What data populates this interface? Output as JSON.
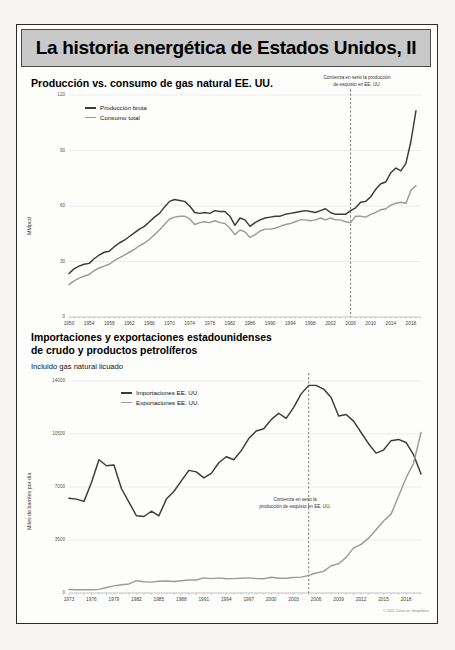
{
  "banner": {
    "title": "La historia energética de Estados Unidos, II"
  },
  "credit": "© 2022 Julian on Geopolitics",
  "chart_data": [
    {
      "type": "line",
      "title": "Producción vs. consumo de gas natural EE. UU.",
      "subtitle": "",
      "xlabel": "",
      "ylabel": "MMpcd",
      "ylim": [
        0,
        120
      ],
      "yticks": [
        0,
        30,
        60,
        90,
        120
      ],
      "xlim": [
        1950,
        2020
      ],
      "xticks": [
        1950,
        1954,
        1958,
        1962,
        1966,
        1970,
        1974,
        1978,
        1982,
        1986,
        1990,
        1994,
        1998,
        2002,
        2006,
        2010,
        2014,
        2018
      ],
      "grid": true,
      "legend_position": "top-left",
      "annotation": "Comienza en serio la producción\nde esquisto en EE. UU.",
      "annotation_line_1": "Comienza en serio la producción",
      "annotation_line_2": "de esquisto en EE. UU.",
      "annotation_x": 2006,
      "colors": {
        "produccion": "#3a3a3a",
        "consumo": "#9b9b9b"
      },
      "x": [
        1950,
        1951,
        1952,
        1953,
        1954,
        1955,
        1956,
        1957,
        1958,
        1959,
        1960,
        1961,
        1962,
        1963,
        1964,
        1965,
        1966,
        1967,
        1968,
        1969,
        1970,
        1971,
        1972,
        1973,
        1974,
        1975,
        1976,
        1977,
        1978,
        1979,
        1980,
        1981,
        1982,
        1983,
        1984,
        1985,
        1986,
        1987,
        1988,
        1989,
        1990,
        1991,
        1992,
        1993,
        1994,
        1995,
        1996,
        1997,
        1998,
        1999,
        2000,
        2001,
        2002,
        2003,
        2004,
        2005,
        2006,
        2007,
        2008,
        2009,
        2010,
        2011,
        2012,
        2013,
        2014,
        2015,
        2016,
        2017,
        2018,
        2019
      ],
      "series": [
        {
          "name": "Producción bruta",
          "values": [
            23.5,
            26.0,
            27.5,
            28.5,
            29.0,
            31.5,
            33.5,
            35.0,
            35.5,
            38.0,
            40.0,
            41.5,
            43.5,
            45.5,
            47.5,
            49.0,
            51.5,
            54.0,
            56.0,
            59.5,
            62.5,
            63.5,
            63.0,
            62.5,
            60.0,
            56.5,
            56.0,
            56.5,
            56.0,
            57.5,
            57.0,
            57.0,
            54.5,
            49.5,
            53.5,
            52.5,
            49.0,
            51.0,
            52.5,
            53.5,
            54.0,
            54.5,
            54.5,
            55.5,
            56.0,
            56.5,
            57.0,
            57.5,
            57.0,
            56.5,
            57.5,
            58.5,
            56.5,
            55.5,
            55.5,
            55.5,
            57.5,
            59.0,
            62.0,
            62.5,
            65.0,
            69.0,
            72.0,
            73.0,
            78.0,
            80.5,
            79.0,
            83.0,
            95.0,
            111.5
          ]
        },
        {
          "name": "Consumo total",
          "values": [
            17.5,
            19.5,
            21.0,
            22.0,
            23.0,
            25.0,
            26.5,
            27.5,
            28.5,
            30.5,
            32.0,
            33.5,
            35.0,
            36.5,
            38.5,
            40.0,
            42.0,
            44.5,
            47.0,
            50.0,
            53.0,
            54.0,
            54.5,
            54.5,
            53.0,
            50.0,
            51.0,
            51.5,
            51.0,
            52.0,
            51.0,
            50.5,
            48.0,
            44.5,
            47.0,
            46.0,
            43.0,
            44.5,
            46.5,
            47.5,
            47.5,
            48.0,
            49.0,
            50.0,
            50.5,
            51.5,
            52.5,
            52.5,
            52.0,
            52.5,
            53.5,
            52.5,
            53.5,
            52.5,
            52.5,
            51.5,
            51.0,
            54.5,
            54.5,
            54.0,
            55.5,
            56.5,
            58.0,
            58.5,
            60.5,
            61.5,
            62.0,
            61.5,
            68.5,
            71.0
          ]
        }
      ]
    },
    {
      "type": "line",
      "title": "Importaciones y exportaciones estadounidenses",
      "title_line_2": "de crudo y productos petrolíferos",
      "subtitle": "Incluido gas natural licuado",
      "xlabel": "",
      "ylabel": "Miles de barriles por día",
      "ylim": [
        0,
        14000
      ],
      "yticks": [
        0,
        3500,
        7000,
        10500,
        14000
      ],
      "xlim": [
        1973,
        2020
      ],
      "xticks": [
        1973,
        1976,
        1979,
        1982,
        1985,
        1988,
        1991,
        1994,
        1997,
        2000,
        2003,
        2006,
        2009,
        2012,
        2015,
        2018
      ],
      "grid": true,
      "legend_position": "top-center",
      "annotation_line_1": "Comienza en serio la",
      "annotation_line_2": "producción de esquisto en EE. UU.",
      "annotation_x": 2005,
      "colors": {
        "importaciones": "#3a3a3a",
        "exportaciones": "#9b9b9b"
      },
      "x": [
        1973,
        1974,
        1975,
        1976,
        1977,
        1978,
        1979,
        1980,
        1981,
        1982,
        1983,
        1984,
        1985,
        1986,
        1987,
        1988,
        1989,
        1990,
        1991,
        1992,
        1993,
        1994,
        1995,
        1996,
        1997,
        1998,
        1999,
        2000,
        2001,
        2002,
        2003,
        2004,
        2005,
        2006,
        2007,
        2008,
        2009,
        2010,
        2011,
        2012,
        2013,
        2014,
        2015,
        2016,
        2017,
        2018,
        2019,
        2020
      ],
      "series": [
        {
          "name": "Importaciones EE. UU.",
          "values": [
            6260,
            6200,
            6050,
            7300,
            8800,
            8400,
            8450,
            6900,
            6000,
            5100,
            5050,
            5400,
            5100,
            6200,
            6700,
            7400,
            8100,
            8000,
            7600,
            7900,
            8600,
            9000,
            8800,
            9400,
            10200,
            10700,
            10850,
            11450,
            11870,
            11530,
            12260,
            13150,
            13710,
            13710,
            13470,
            12915,
            11690,
            11790,
            11350,
            10600,
            9860,
            9240,
            9440,
            10060,
            10140,
            9940,
            9140,
            7860
          ]
        },
        {
          "name": "Exportaciones EE. UU.",
          "values": [
            230,
            220,
            210,
            220,
            240,
            360,
            470,
            550,
            600,
            815,
            740,
            720,
            780,
            790,
            765,
            815,
            860,
            860,
            1000,
            950,
            1000,
            940,
            950,
            980,
            1000,
            950,
            940,
            1040,
            970,
            980,
            1020,
            1050,
            1160,
            1320,
            1430,
            1800,
            1930,
            2350,
            2980,
            3210,
            3620,
            4180,
            4760,
            5210,
            6390,
            7600,
            8550,
            10600
          ]
        }
      ]
    }
  ]
}
